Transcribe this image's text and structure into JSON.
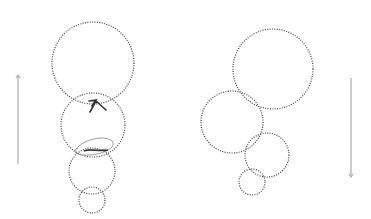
{
  "diagram": {
    "background": "#ffffff",
    "circle_stroke": "#444444",
    "arrow_stroke": "#b0b0b0",
    "scribble_stroke": "#333333",
    "ellipse_stroke": "#9a9a9a",
    "left_group": {
      "circles": [
        {
          "cx": 93,
          "cy": 63,
          "r": 41
        },
        {
          "cx": 93,
          "cy": 125,
          "r": 32
        },
        {
          "cx": 92,
          "cy": 171,
          "r": 23
        },
        {
          "cx": 92,
          "cy": 200,
          "r": 13
        }
      ],
      "arrow": {
        "x": 18,
        "y1": 164,
        "y2": 75,
        "direction": "up"
      }
    },
    "right_group": {
      "circles": [
        {
          "cx": 273,
          "cy": 69,
          "r": 40
        },
        {
          "cx": 232,
          "cy": 122,
          "r": 31
        },
        {
          "cx": 267,
          "cy": 155,
          "r": 22
        },
        {
          "cx": 252,
          "cy": 182,
          "r": 13
        }
      ],
      "arrow": {
        "x": 351,
        "y1": 78,
        "y2": 177,
        "direction": "down"
      }
    }
  }
}
